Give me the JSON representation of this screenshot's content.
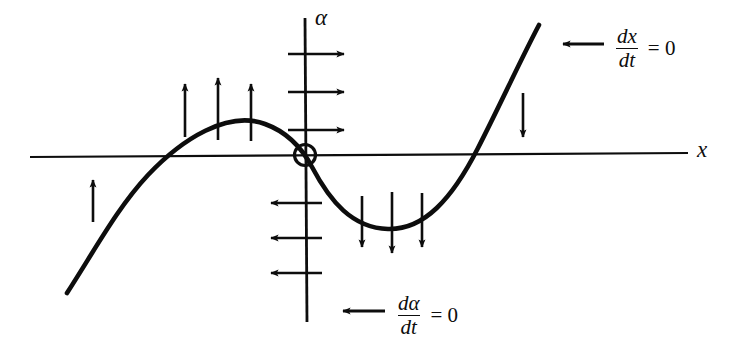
{
  "figure": {
    "background_color": "#ffffff",
    "stroke_color": "#0d0d0d",
    "axes": {
      "x_axis_label": "x",
      "y_axis_label": "α",
      "x_axis": {
        "x1": 30,
        "y1": 157,
        "x2": 688,
        "y2": 153
      },
      "y_axis": {
        "x1": 305,
        "y1": 18,
        "x2": 307,
        "y2": 322
      }
    },
    "equilibrium": {
      "name": "fixed-point",
      "cx": 305,
      "cy": 155,
      "r": 11
    },
    "nullclines": [
      {
        "name": "dx-dt-nullcline",
        "kind": "cubic-curve",
        "path": "M 67 293 C 96 248 118 207 148 175 C 182 139 228 110 265 124 C 290 133 303 150 312 167 C 330 201 352 228 388 229 C 424 230 452 199 478 148 C 501 103 521 59 539 25"
      },
      {
        "name": "d-alpha-dt-nullcline",
        "kind": "vertical-axis"
      }
    ],
    "annotations": [
      {
        "name": "dx-dt-label",
        "numerator": "dx",
        "denominator": "dt",
        "equals": "= 0",
        "arrow": "left-arrow",
        "x": 590,
        "y": 28
      },
      {
        "name": "d-alpha-dt-label",
        "numerator": "dα",
        "denominator": "dt",
        "equals": "= 0",
        "arrow": "left-arrow",
        "x": 373,
        "y": 295
      }
    ],
    "flow_arrows": [
      {
        "name": "flow-arrow-up-left-branch",
        "direction": "up",
        "x": 93,
        "y_from": 222,
        "y_to": 178
      },
      {
        "name": "flow-arrow-up-hump-1",
        "direction": "up",
        "x": 185,
        "y_from": 135,
        "y_to": 82
      },
      {
        "name": "flow-arrow-up-hump-2",
        "direction": "up",
        "x": 218,
        "y_from": 138,
        "y_to": 76
      },
      {
        "name": "flow-arrow-up-hump-3",
        "direction": "up",
        "x": 251,
        "y_from": 139,
        "y_to": 82
      },
      {
        "name": "flow-arrow-right-axis-1",
        "direction": "right",
        "y": 54,
        "x_from": 292,
        "x_to": 345
      },
      {
        "name": "flow-arrow-right-axis-2",
        "direction": "right",
        "y": 92,
        "x_from": 292,
        "x_to": 345
      },
      {
        "name": "flow-arrow-right-axis-3",
        "direction": "right",
        "y": 130,
        "x_from": 292,
        "x_to": 345
      },
      {
        "name": "flow-arrow-left-axis-1",
        "direction": "left",
        "y": 203,
        "x_from": 320,
        "x_to": 272
      },
      {
        "name": "flow-arrow-left-axis-2",
        "direction": "left",
        "y": 238,
        "x_from": 320,
        "x_to": 272
      },
      {
        "name": "flow-arrow-left-axis-3",
        "direction": "left",
        "y": 273,
        "x_from": 320,
        "x_to": 272
      },
      {
        "name": "flow-arrow-down-valley-1",
        "direction": "down",
        "x": 362,
        "y_from": 196,
        "y_to": 249
      },
      {
        "name": "flow-arrow-down-valley-2",
        "direction": "down",
        "x": 392,
        "y_from": 192,
        "y_to": 255
      },
      {
        "name": "flow-arrow-down-valley-3",
        "direction": "down",
        "x": 422,
        "y_from": 193,
        "y_to": 249
      },
      {
        "name": "flow-arrow-down-right-branch",
        "direction": "down",
        "x": 523,
        "y_from": 93,
        "y_to": 139
      }
    ]
  }
}
